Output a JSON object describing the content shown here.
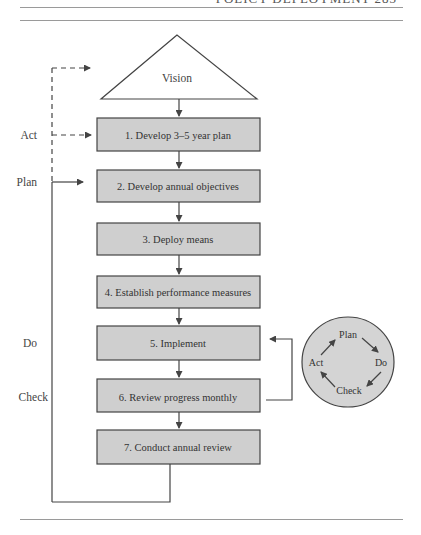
{
  "page": {
    "running_header": "POLICY DEPLOYMENT 283"
  },
  "diagram": {
    "vision_label": "Vision",
    "steps": [
      {
        "label": "1. Develop 3–5 year plan"
      },
      {
        "label": "2. Develop annual objectives"
      },
      {
        "label": "3. Deploy means"
      },
      {
        "label": "4. Establish performance measures"
      },
      {
        "label": "5. Implement"
      },
      {
        "label": "6. Review progress monthly"
      },
      {
        "label": "7. Conduct annual review"
      }
    ],
    "side_labels": {
      "act": "Act",
      "plan": "Plan",
      "do": "Do",
      "check": "Check"
    },
    "pdca_cycle": {
      "plan": "Plan",
      "do": "Do",
      "check": "Check",
      "act": "Act"
    },
    "colors": {
      "box_fill": "#cfcfcf",
      "box_stroke": "#444444",
      "circle_fill": "#d4d4d4",
      "line": "#444444"
    }
  }
}
